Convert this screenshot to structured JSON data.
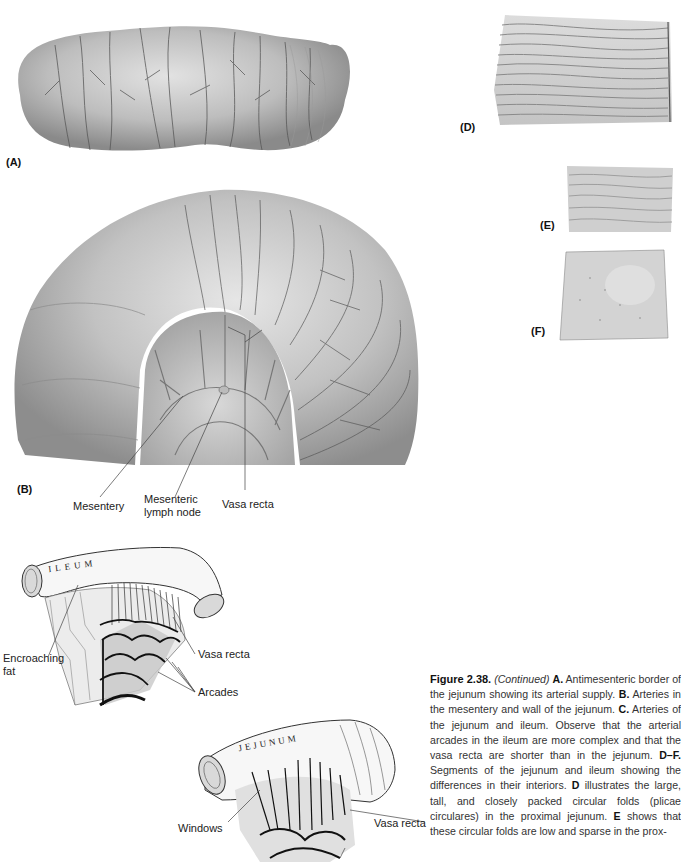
{
  "panels": {
    "A": {
      "label": "(A)",
      "description": "Antimesenteric border of jejunum with arterial supply"
    },
    "B": {
      "label": "(B)",
      "description": "Arteries in mesentery and wall of jejunum",
      "callouts": [
        "Mesentery",
        "Mesenteric lymph node",
        "Vasa recta"
      ],
      "callout_lines": {
        "mesentery": "Mesentery",
        "lymph_1": "Mesenteric",
        "lymph_2": "lymph node",
        "vasa": "Vasa recta"
      }
    },
    "C_ileum": {
      "organ_label": "ILEUM",
      "callouts": {
        "encroaching_1": "Encroaching",
        "encroaching_2": "fat",
        "vasa": "Vasa recta",
        "arcades": "Arcades"
      }
    },
    "C_jejunum": {
      "organ_label": "JEJUNUM",
      "callouts": {
        "windows": "Windows",
        "vasa": "Vasa recta"
      }
    },
    "D": {
      "label": "(D)",
      "description": "Proximal jejunum interior - large, tall, closely packed circular folds"
    },
    "E": {
      "label": "(E)",
      "description": "Distal jejunum interior - low, sparse circular folds"
    },
    "F": {
      "label": "(F)",
      "description": "Distal ileum interior - no circular folds"
    }
  },
  "caption": {
    "figure": "Figure 2.38.",
    "continued": "(Continued)",
    "parts": [
      {
        "key": "A.",
        "text": " Antimesenteric border of the jejunum showing its arterial supply. "
      },
      {
        "key": "B.",
        "text": " Arteries in the mesentery and wall of the jejunum. "
      },
      {
        "key": "C.",
        "text": " Arteries of the jejunum and ileum. Observe that the arterial arcades in the ileum are more complex and that the vasa recta are shorter than in the jejunum. "
      },
      {
        "key": "D–F.",
        "text": " Segments of the jejunum and ileum showing the differences in their interiors. "
      },
      {
        "key": "D",
        "text": " illustrates the large, tall, and closely packed circular folds (plicae circulares) in the proximal jejunum. "
      },
      {
        "key": "E",
        "text": " shows that these circular folds are low and sparse in the prox-"
      }
    ]
  }
}
